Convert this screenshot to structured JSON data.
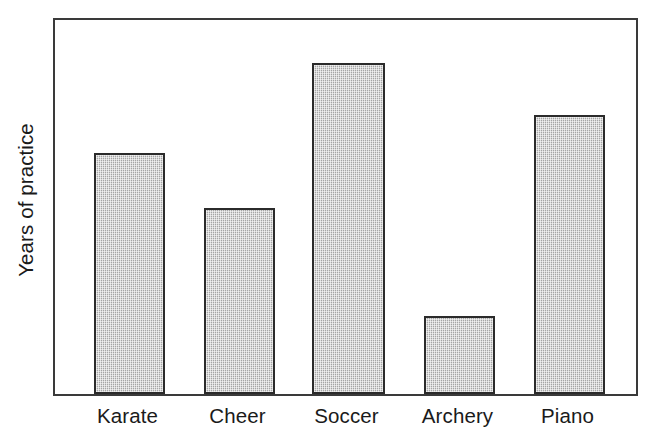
{
  "chart_data": {
    "type": "bar",
    "title": "",
    "subtitle": "",
    "xlabel": "",
    "ylabel": "Years of practice",
    "categories": [
      "Karate",
      "Cheer",
      "Soccer",
      "Archery",
      "Piano"
    ],
    "values": [
      4.8,
      3.7,
      6.6,
      1.5,
      5.6
    ],
    "series": [
      {
        "name": "Years of practice",
        "values": [
          4.8,
          3.7,
          6.6,
          1.5,
          5.6
        ]
      }
    ],
    "ylim": [
      0,
      7.5
    ],
    "grid": false,
    "legend": null,
    "legend_position": "none",
    "tick_labels_y": [],
    "annotations": [],
    "bar_fill_color": "#bcbcbc",
    "bar_edge_color": "#2b2b2b",
    "frame_color": "#3a3a3a",
    "background_color": "#ffffff",
    "text_color": "#1a1a1a"
  },
  "geometry": {
    "bars": [
      {
        "label": "Karate",
        "left_px": 39,
        "width_px": 71,
        "height_px": 241
      },
      {
        "label": "Cheer",
        "left_px": 149,
        "width_px": 71,
        "height_px": 186
      },
      {
        "label": "Soccer",
        "left_px": 257,
        "width_px": 73,
        "height_px": 331
      },
      {
        "label": "Archery",
        "left_px": 369,
        "width_px": 71,
        "height_px": 78
      },
      {
        "label": "Piano",
        "left_px": 479,
        "width_px": 71,
        "height_px": 279
      }
    ]
  }
}
